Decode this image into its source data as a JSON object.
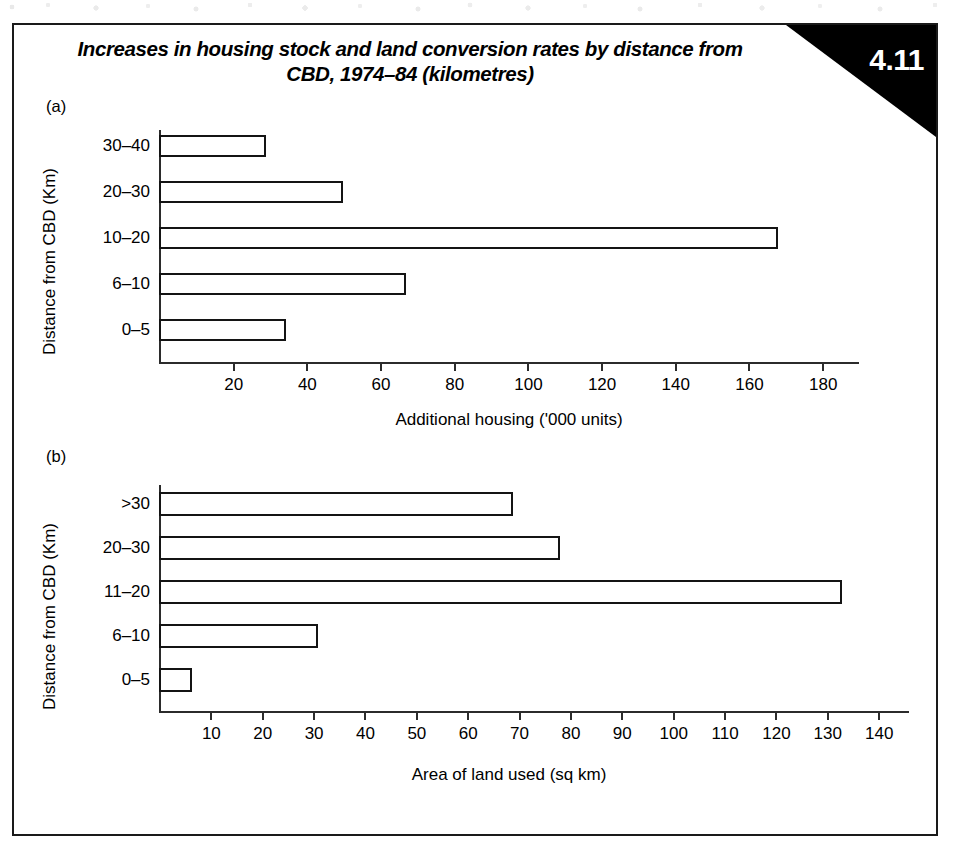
{
  "figure": {
    "number": "4.11",
    "title": "Increases in housing stock and land conversion rates by distance from CBD, 1974–84 (kilometres)",
    "panel_a_tag": "(a)",
    "panel_b_tag": "(b)"
  },
  "chart_data": [
    {
      "type": "bar",
      "orientation": "horizontal",
      "panel": "(a)",
      "title": "Increases in housing stock and land conversion rates by distance from CBD, 1974–84 (kilometres)",
      "categories": [
        "0–5",
        "6–10",
        "10–20",
        "20–30",
        "30–40"
      ],
      "values": [
        34.5,
        67,
        168,
        50,
        29
      ],
      "xlabel": "Additional housing ('000 units)",
      "ylabel": "Distance from CBD (Km)",
      "xlim": [
        0,
        190
      ],
      "xticks": [
        20,
        40,
        60,
        80,
        100,
        120,
        140,
        160,
        180
      ],
      "xticklabels": [
        "20",
        "40",
        "60",
        "80",
        "100",
        "120",
        "140",
        "160",
        "180"
      ],
      "grid": false,
      "legend": false,
      "bar_facecolor": "#ffffff",
      "bar_edgecolor": "#141414"
    },
    {
      "type": "bar",
      "orientation": "horizontal",
      "panel": "(b)",
      "categories": [
        "0–5",
        "6–10",
        "11–20",
        "20–30",
        ">30"
      ],
      "values": [
        6.5,
        31,
        133,
        78,
        69
      ],
      "xlabel": "Area of land used (sq km)",
      "ylabel": "Distance from CBD (Km)",
      "xlim": [
        0,
        146
      ],
      "xticks": [
        10,
        20,
        30,
        40,
        50,
        60,
        70,
        80,
        90,
        100,
        110,
        120,
        130,
        140
      ],
      "xticklabels": [
        "10",
        "20",
        "30",
        "40",
        "50",
        "60",
        "70",
        "80",
        "90",
        "100",
        "110",
        "120",
        "130",
        "140"
      ],
      "grid": false,
      "legend": false,
      "bar_facecolor": "#ffffff",
      "bar_edgecolor": "#141414"
    }
  ],
  "colors": {
    "frame": "#1a1a1a",
    "badge_bg": "#000000",
    "badge_text": "#ffffff",
    "axis": "#2b2b2b",
    "page": "#ffffff"
  }
}
